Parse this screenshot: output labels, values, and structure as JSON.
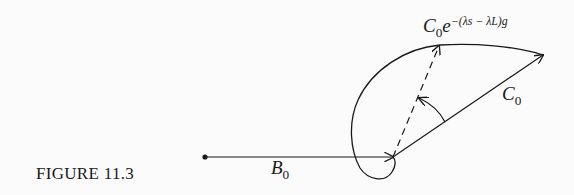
{
  "figure": {
    "caption": "FIGURE 11.3",
    "labels": {
      "b0": {
        "main": "B",
        "sub": "0"
      },
      "c0": {
        "main": "C",
        "sub": "0"
      },
      "rotated": {
        "main": "C",
        "sub": "0",
        "base": "e",
        "exponent": "−(λs − λL)g"
      }
    },
    "elements": [
      "vector B0 (horizontal, from origin dot)",
      "vector C0 (from tip of B0, up-right)",
      "dashed rotated vector C0e^-(λs-λL)g",
      "rotation arc arrow between C0 and dashed vector",
      "loop trajectory curve"
    ],
    "colors": {
      "ink": "#1a1a1a",
      "paper": "#fbfbfb"
    }
  }
}
